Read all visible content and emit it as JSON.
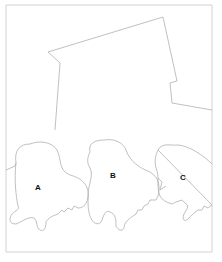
{
  "figure": {
    "type": "line-drawing",
    "labels": [
      {
        "id": "A",
        "text": "A",
        "x": 38,
        "y": 190
      },
      {
        "id": "B",
        "text": "B",
        "x": 113,
        "y": 178
      },
      {
        "id": "C",
        "text": "C",
        "x": 183,
        "y": 180
      }
    ],
    "colors": {
      "stroke": "#b0b0b0",
      "label": "#111111",
      "background": "#ffffff"
    }
  }
}
